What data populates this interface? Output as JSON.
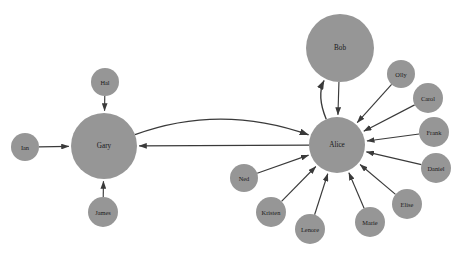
{
  "graph": {
    "title": "Network Graph",
    "background_color": "#ffffff",
    "node_color": "#969696",
    "edge_color": "#3a3a3a",
    "label_color": "#1a1a1a",
    "width": 460,
    "height": 269,
    "node_count": 16,
    "edge_count": 16,
    "nodes": [
      {
        "id": "alice",
        "label": "Alice",
        "x": 337,
        "y": 145,
        "r": 28,
        "font_size": 7.2,
        "role": "hub"
      },
      {
        "id": "gary",
        "label": "Gary",
        "x": 104,
        "y": 146,
        "r": 33,
        "font_size": 7.2,
        "role": "hub"
      },
      {
        "id": "bob",
        "label": "Bob",
        "x": 340,
        "y": 48,
        "r": 34,
        "font_size": 7.2,
        "role": "large"
      },
      {
        "id": "hal",
        "label": "Hal",
        "x": 105,
        "y": 82,
        "r": 14,
        "font_size": 6.4,
        "role": "satellite"
      },
      {
        "id": "ian",
        "label": "Ian",
        "x": 25,
        "y": 147,
        "r": 14,
        "font_size": 6.4,
        "role": "satellite"
      },
      {
        "id": "james",
        "label": "James",
        "x": 103,
        "y": 212,
        "r": 15,
        "font_size": 6.4,
        "role": "satellite"
      },
      {
        "id": "olly",
        "label": "Olly",
        "x": 401,
        "y": 74,
        "r": 14,
        "font_size": 6.4,
        "role": "satellite"
      },
      {
        "id": "carol",
        "label": "Carol",
        "x": 428,
        "y": 98,
        "r": 15,
        "font_size": 6.4,
        "role": "satellite"
      },
      {
        "id": "frank",
        "label": "Frank",
        "x": 434,
        "y": 132,
        "r": 15,
        "font_size": 6.4,
        "role": "satellite"
      },
      {
        "id": "daniel",
        "label": "Daniel",
        "x": 436,
        "y": 168,
        "r": 15,
        "font_size": 6.4,
        "role": "satellite"
      },
      {
        "id": "elise",
        "label": "Elise",
        "x": 407,
        "y": 204,
        "r": 15,
        "font_size": 6.4,
        "role": "satellite"
      },
      {
        "id": "marie",
        "label": "Marie",
        "x": 370,
        "y": 222,
        "r": 15,
        "font_size": 6.4,
        "role": "satellite"
      },
      {
        "id": "lenore",
        "label": "Lenore",
        "x": 310,
        "y": 229,
        "r": 15,
        "font_size": 6.4,
        "role": "satellite"
      },
      {
        "id": "kristen",
        "label": "Kristen",
        "x": 271,
        "y": 212,
        "r": 15,
        "font_size": 6.4,
        "role": "satellite"
      },
      {
        "id": "ned",
        "label": "Ned",
        "x": 244,
        "y": 178,
        "r": 14,
        "font_size": 6.4,
        "role": "satellite"
      }
    ],
    "edges": [
      {
        "id": "hal-gary",
        "source": "hal",
        "target": "gary",
        "type": "straight",
        "directed": true
      },
      {
        "id": "ian-gary",
        "source": "ian",
        "target": "gary",
        "type": "straight",
        "directed": true
      },
      {
        "id": "james-gary",
        "source": "james",
        "target": "gary",
        "type": "straight",
        "directed": true
      },
      {
        "id": "gary-alice",
        "source": "gary",
        "target": "alice",
        "type": "curved",
        "directed": true
      },
      {
        "id": "alice-gary",
        "source": "alice",
        "target": "gary",
        "type": "straight",
        "directed": true
      },
      {
        "id": "alice-bob",
        "source": "alice",
        "target": "bob",
        "type": "curved",
        "directed": true
      },
      {
        "id": "bob-alice",
        "source": "bob",
        "target": "alice",
        "type": "straight",
        "directed": true
      },
      {
        "id": "olly-alice",
        "source": "olly",
        "target": "alice",
        "type": "straight",
        "directed": true
      },
      {
        "id": "carol-alice",
        "source": "carol",
        "target": "alice",
        "type": "straight",
        "directed": true
      },
      {
        "id": "frank-alice",
        "source": "frank",
        "target": "alice",
        "type": "straight",
        "directed": true
      },
      {
        "id": "daniel-alice",
        "source": "daniel",
        "target": "alice",
        "type": "straight",
        "directed": true
      },
      {
        "id": "elise-alice",
        "source": "elise",
        "target": "alice",
        "type": "straight",
        "directed": true
      },
      {
        "id": "marie-alice",
        "source": "marie",
        "target": "alice",
        "type": "straight",
        "directed": true
      },
      {
        "id": "lenore-alice",
        "source": "lenore",
        "target": "alice",
        "type": "straight",
        "directed": true
      },
      {
        "id": "kristen-alice",
        "source": "kristen",
        "target": "alice",
        "type": "straight",
        "directed": true
      },
      {
        "id": "ned-alice",
        "source": "ned",
        "target": "alice",
        "type": "straight",
        "directed": true
      }
    ],
    "curve_params": {
      "gary-alice": {
        "bow": -42
      },
      "alice-bob": {
        "bow": -22
      }
    }
  }
}
